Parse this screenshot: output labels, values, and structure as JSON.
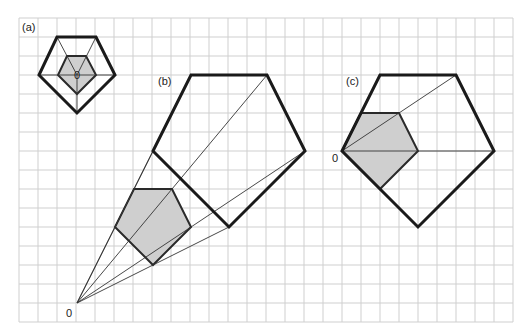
{
  "figure": {
    "grid": {
      "x0": 19,
      "y0": 18,
      "step": 19,
      "cols": 26,
      "rows": 16
    },
    "panels": [
      {
        "label": "(a)",
        "label_pos": [
          22,
          31
        ],
        "center_label": "0",
        "center": [
          77,
          75
        ],
        "outer": [
          [
            57,
            37
          ],
          [
            96,
            37
          ],
          [
            115,
            75
          ],
          [
            77,
            113
          ],
          [
            39,
            75
          ]
        ],
        "inner": [
          [
            67,
            56
          ],
          [
            86,
            56
          ],
          [
            96,
            75
          ],
          [
            77,
            94
          ],
          [
            58,
            75
          ]
        ]
      },
      {
        "label": "(b)",
        "label_pos": [
          158,
          85
        ],
        "center_label": "0",
        "center": [
          77,
          303
        ],
        "outer": [
          [
            191,
            75
          ],
          [
            267,
            75
          ],
          [
            305,
            151
          ],
          [
            229,
            227
          ],
          [
            153,
            151
          ]
        ],
        "inner": [
          [
            134,
            189
          ],
          [
            172,
            189
          ],
          [
            191,
            227
          ],
          [
            153,
            265
          ],
          [
            115,
            227
          ]
        ]
      },
      {
        "label": "(c)",
        "label_pos": [
          346,
          85
        ],
        "center_label": "0",
        "center": [
          342,
          151
        ],
        "outer": [
          [
            380,
            75
          ],
          [
            456,
            75
          ],
          [
            494,
            151
          ],
          [
            418,
            227
          ],
          [
            342,
            151
          ]
        ],
        "inner": [
          [
            361,
            113
          ],
          [
            399,
            113
          ],
          [
            418,
            151
          ],
          [
            380,
            189
          ],
          [
            342,
            151
          ]
        ]
      }
    ],
    "colors": {
      "grid": "#cfcfcf",
      "outline": "#1a1a1a",
      "fill": "#cfcfcf"
    }
  }
}
